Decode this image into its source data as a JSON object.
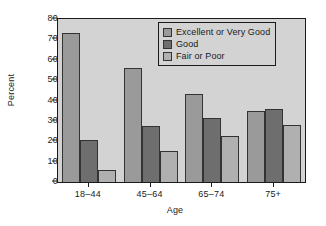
{
  "chart_data": {
    "type": "bar",
    "title": "",
    "xlabel": "Age",
    "ylabel": "Percent",
    "categories": [
      "18–44",
      "45–64",
      "65–74",
      "75+"
    ],
    "series": [
      {
        "name": "Excellent or Very Good",
        "color": "#9a9a9a",
        "values": [
          73,
          56,
          43,
          35
        ]
      },
      {
        "name": "Good",
        "color": "#6e6e6e",
        "values": [
          20.7,
          27.7,
          31.5,
          36
        ]
      },
      {
        "name": "Fair or Poor",
        "color": "#b0b0b0",
        "values": [
          5.8,
          15,
          22.7,
          27.8
        ]
      }
    ],
    "ylim": [
      0,
      80
    ],
    "ytick_values": [
      0,
      10,
      20,
      30,
      40,
      50,
      60,
      70,
      80
    ],
    "ytick_labels": [
      "0",
      "10",
      "20",
      "30",
      "40",
      "50",
      "60",
      "70",
      "80"
    ],
    "grid": false,
    "legend_position": "top-right",
    "plot_background": "#d3d3d3",
    "figure_background": "#ffffff",
    "axis_color": "#1a1a1a"
  }
}
